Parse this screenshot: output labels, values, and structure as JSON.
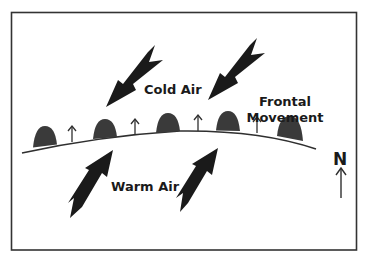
{
  "diagram": {
    "labels": {
      "cold_air": "Cold Air",
      "warm_air": "Warm Air",
      "frontal_movement_line1": "Frontal",
      "frontal_movement_line2": "Movement",
      "north": "N"
    },
    "colors": {
      "border": "#333333",
      "front_line": "#333333",
      "front_symbols": "#3a3a3a",
      "arrows": "#1a1a1a",
      "text": "#1a1a1a",
      "background": "#ffffff"
    },
    "front": {
      "type": "warm front",
      "semicircle_count": 5,
      "movement_arrow_count": 4
    },
    "air_arrows": {
      "cold_air_count": 2,
      "warm_air_count": 2
    }
  }
}
